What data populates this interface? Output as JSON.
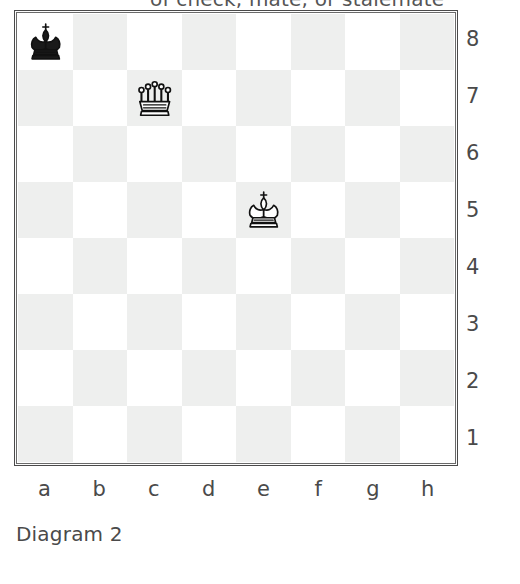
{
  "header": {
    "clipped_text": "of check, mate, or stalemate"
  },
  "diagram": {
    "caption": "Diagram 2",
    "file_labels": [
      "a",
      "b",
      "c",
      "d",
      "e",
      "f",
      "g",
      "h"
    ],
    "rank_labels": [
      "8",
      "7",
      "6",
      "5",
      "4",
      "3",
      "2",
      "1"
    ],
    "light_square_color": "#ffffff",
    "dark_square_color": "#eeefee",
    "border_color": "#4a4a4a",
    "pieces": [
      {
        "square": "a8",
        "piece": "black-king",
        "color": "black",
        "type": "king"
      },
      {
        "square": "c7",
        "piece": "white-queen",
        "color": "white",
        "type": "queen"
      },
      {
        "square": "e5",
        "piece": "white-king",
        "color": "white",
        "type": "king"
      }
    ]
  },
  "chart_data": {
    "type": "table",
    "title": "Diagram 2",
    "xlabel": "files",
    "ylabel": "ranks",
    "categories": [
      "a",
      "b",
      "c",
      "d",
      "e",
      "f",
      "g",
      "h"
    ],
    "rows": [
      "8",
      "7",
      "6",
      "5",
      "4",
      "3",
      "2",
      "1"
    ],
    "grid": true,
    "legend": "none",
    "board": [
      [
        "bK",
        "",
        "",
        "",
        "",
        "",
        "",
        ""
      ],
      [
        "",
        "",
        "wQ",
        "",
        "",
        "",
        "",
        ""
      ],
      [
        "",
        "",
        "",
        "",
        "",
        "",
        "",
        ""
      ],
      [
        "",
        "",
        "",
        "",
        "wK",
        "",
        "",
        ""
      ],
      [
        "",
        "",
        "",
        "",
        "",
        "",
        "",
        ""
      ],
      [
        "",
        "",
        "",
        "",
        "",
        "",
        "",
        ""
      ],
      [
        "",
        "",
        "",
        "",
        "",
        "",
        "",
        ""
      ],
      [
        "",
        "",
        "",
        "",
        "",
        "",
        "",
        ""
      ]
    ]
  }
}
